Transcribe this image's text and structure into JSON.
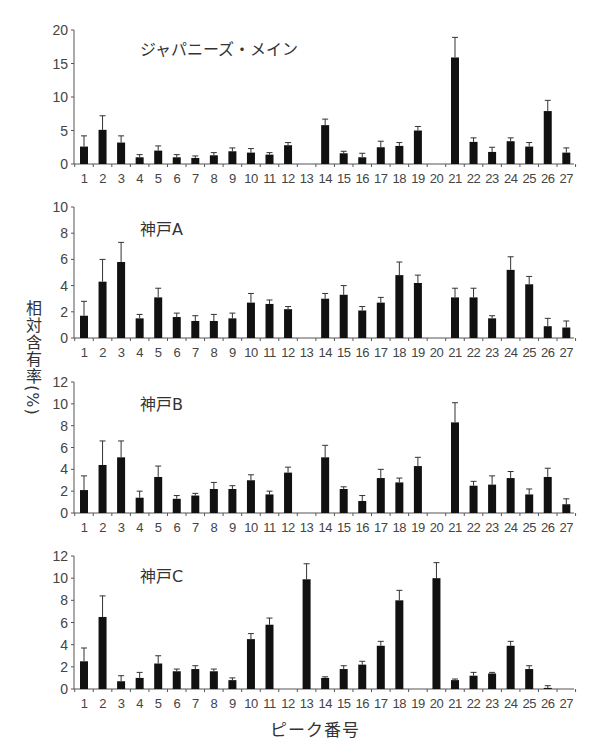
{
  "figure": {
    "ylabel": "相対含有率(%)",
    "xlabel": "ピーク番号"
  },
  "chart_data": [
    {
      "type": "bar",
      "title": "ジャパニーズ・メイン",
      "xlabel": "ピーク番号",
      "ylabel": "相対含有率(%)",
      "categories": [
        "1",
        "2",
        "3",
        "4",
        "5",
        "6",
        "7",
        "8",
        "9",
        "10",
        "11",
        "12",
        "13",
        "14",
        "15",
        "16",
        "17",
        "18",
        "19",
        "20",
        "21",
        "22",
        "23",
        "24",
        "25",
        "26",
        "27"
      ],
      "values": [
        2.6,
        5.1,
        3.2,
        1.0,
        2.0,
        1.0,
        0.9,
        1.3,
        1.9,
        1.7,
        1.4,
        2.8,
        0,
        5.8,
        1.6,
        1.0,
        2.5,
        2.7,
        5.0,
        0,
        15.9,
        3.3,
        1.8,
        3.4,
        2.6,
        7.9,
        1.7
      ],
      "errors": [
        1.6,
        2.1,
        1.0,
        0.4,
        0.7,
        0.4,
        0.3,
        0.4,
        0.5,
        0.6,
        0.3,
        0.4,
        0,
        0.9,
        0.3,
        0.6,
        0.9,
        0.5,
        0.6,
        0,
        3.0,
        0.6,
        0.7,
        0.5,
        0.6,
        1.6,
        0.7
      ],
      "ylim": [
        0,
        20
      ],
      "yticks": [
        0,
        5,
        10,
        15,
        20
      ],
      "grid": false,
      "legend": "none"
    },
    {
      "type": "bar",
      "title": "神戸A",
      "xlabel": "ピーク番号",
      "ylabel": "相対含有率(%)",
      "categories": [
        "1",
        "2",
        "3",
        "4",
        "5",
        "6",
        "7",
        "8",
        "9",
        "10",
        "11",
        "12",
        "13",
        "14",
        "15",
        "16",
        "17",
        "18",
        "19",
        "20",
        "21",
        "22",
        "23",
        "24",
        "25",
        "26",
        "27"
      ],
      "values": [
        1.7,
        4.3,
        5.8,
        1.5,
        3.1,
        1.6,
        1.3,
        1.3,
        1.5,
        2.7,
        2.6,
        2.2,
        0,
        3.0,
        3.3,
        2.1,
        2.7,
        4.8,
        4.2,
        0,
        3.1,
        3.1,
        1.5,
        5.2,
        4.1,
        0.9,
        0.8
      ],
      "errors": [
        1.1,
        1.7,
        1.5,
        0.3,
        0.7,
        0.3,
        0.4,
        0.5,
        0.4,
        0.7,
        0.3,
        0.2,
        0,
        0.4,
        0.7,
        0.3,
        0.4,
        1.0,
        0.6,
        0,
        0.7,
        0.7,
        0.2,
        1.0,
        0.6,
        0.6,
        0.5
      ],
      "ylim": [
        0,
        10
      ],
      "yticks": [
        0,
        2,
        4,
        6,
        8,
        10
      ],
      "grid": false,
      "legend": "none"
    },
    {
      "type": "bar",
      "title": "神戸B",
      "xlabel": "ピーク番号",
      "ylabel": "相対含有率(%)",
      "categories": [
        "1",
        "2",
        "3",
        "4",
        "5",
        "6",
        "7",
        "8",
        "9",
        "10",
        "11",
        "12",
        "13",
        "14",
        "15",
        "16",
        "17",
        "18",
        "19",
        "20",
        "21",
        "22",
        "23",
        "24",
        "25",
        "26",
        "27"
      ],
      "values": [
        2.1,
        4.4,
        5.1,
        1.4,
        3.3,
        1.3,
        1.6,
        2.2,
        2.2,
        3.0,
        1.7,
        3.7,
        0,
        5.1,
        2.2,
        1.1,
        3.2,
        2.8,
        4.3,
        0,
        8.3,
        2.5,
        2.6,
        3.2,
        1.7,
        3.3,
        0.8
      ],
      "errors": [
        1.3,
        2.2,
        1.5,
        0.6,
        1.0,
        0.3,
        0.2,
        0.6,
        0.3,
        0.5,
        0.3,
        0.5,
        0,
        1.1,
        0.2,
        0.5,
        0.8,
        0.4,
        0.8,
        0,
        1.8,
        0.4,
        0.8,
        0.6,
        0.5,
        0.8,
        0.5
      ],
      "ylim": [
        0,
        12
      ],
      "yticks": [
        0,
        2,
        4,
        6,
        8,
        10,
        12
      ],
      "grid": false,
      "legend": "none"
    },
    {
      "type": "bar",
      "title": "神戸C",
      "xlabel": "ピーク番号",
      "ylabel": "相対含有率(%)",
      "categories": [
        "1",
        "2",
        "3",
        "4",
        "5",
        "6",
        "7",
        "8",
        "9",
        "10",
        "11",
        "12",
        "13",
        "14",
        "15",
        "16",
        "17",
        "18",
        "19",
        "20",
        "21",
        "22",
        "23",
        "24",
        "25",
        "26",
        "27"
      ],
      "values": [
        2.5,
        6.5,
        0.7,
        1.0,
        2.3,
        1.6,
        1.8,
        1.6,
        0.8,
        4.5,
        5.8,
        0,
        9.9,
        1.0,
        1.8,
        2.2,
        3.9,
        8.0,
        0,
        10.0,
        0.8,
        1.2,
        1.4,
        3.9,
        1.8,
        0.1,
        0
      ],
      "errors": [
        1.2,
        1.9,
        0.5,
        0.5,
        0.7,
        0.2,
        0.3,
        0.2,
        0.2,
        0.5,
        0.6,
        0,
        1.4,
        0.1,
        0.3,
        0.3,
        0.4,
        0.9,
        0,
        1.4,
        0.1,
        0.3,
        0.1,
        0.4,
        0.3,
        0.2,
        0
      ],
      "ylim": [
        0,
        12
      ],
      "yticks": [
        0,
        2,
        4,
        6,
        8,
        10,
        12
      ],
      "grid": false,
      "legend": "none"
    }
  ]
}
